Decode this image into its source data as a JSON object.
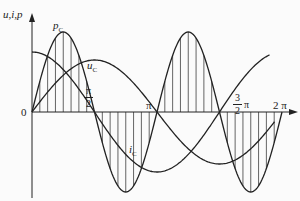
{
  "diagram": {
    "axis_y_label": "u,i,p",
    "origin_label": "0",
    "curves": [
      {
        "name": "p_C",
        "label_main": "p",
        "label_sub": "C",
        "hatched": true
      },
      {
        "name": "u_C",
        "label_main": "u",
        "label_sub": "C",
        "hatched": false
      },
      {
        "name": "i_C",
        "label_main": "i",
        "label_sub": "C",
        "hatched": false
      }
    ],
    "x_ticks": {
      "half_pi": {
        "num": "π",
        "den": "2"
      },
      "pi": "π",
      "three_half_pi": {
        "num": "3",
        "den": "2",
        "suffix": "π"
      },
      "two_pi": "2 π"
    },
    "colors": {
      "line": "#222222",
      "background": "#fbfbfb"
    }
  }
}
